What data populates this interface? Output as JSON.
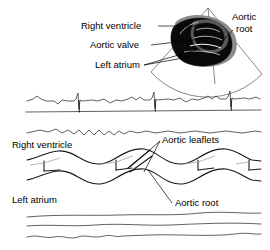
{
  "figure": {
    "panels": {
      "two_d": {
        "name": "2D sector scan",
        "labels": {
          "right_ventricle": "Right ventricle",
          "aortic_valve": "Aortic valve",
          "left_atrium": "Left atrium",
          "aortic_root_line1": "Aortic",
          "aortic_root_line2": "root"
        }
      },
      "ecg": {
        "name": "ECG tracing",
        "beats": 4
      },
      "m_mode": {
        "name": "M-mode tracing",
        "labels": {
          "right_ventricle": "Right ventricle",
          "aortic_leaflets": "Aortic leaflets",
          "left_atrium": "Left atrium",
          "aortic_root": "Aortic root"
        }
      }
    },
    "colors": {
      "background": "#ffffff",
      "ink": "#000000",
      "trace": "#3a3a3a",
      "trace_dark": "#1a1a1a",
      "echo_black": "#0a0a0a",
      "echo_gray": "#8c8c8c",
      "fan_outline": "#555555"
    }
  }
}
